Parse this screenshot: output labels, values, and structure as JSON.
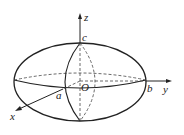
{
  "diagram": {
    "type": "ellipsoid",
    "labels": {
      "z_axis": "z",
      "y_axis": "y",
      "x_axis": "x",
      "origin": "O",
      "a": "a",
      "b": "b",
      "c": "c"
    },
    "colors": {
      "stroke": "#222222",
      "background": "#ffffff"
    }
  }
}
